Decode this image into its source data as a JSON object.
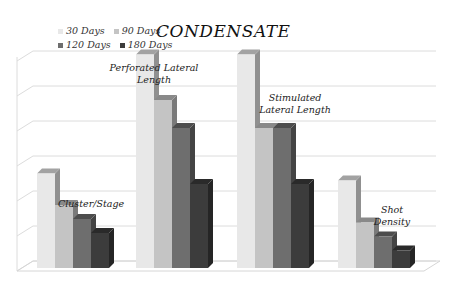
{
  "chart_data": {
    "type": "bar",
    "title": "CONDENSATE",
    "xlabel": "",
    "ylabel": "",
    "ylim": [
      0,
      6
    ],
    "grid": true,
    "legend_position": "top-left",
    "style": "3d-clustered-column",
    "categories": [
      "Cluster/Stage",
      "Perforated Lateral Length",
      "Stimulated Lateral Length",
      "Shot Density"
    ],
    "category_labels": [
      [
        "Cluster/Stage"
      ],
      [
        "Perforated Lateral",
        "Length"
      ],
      [
        "Stimulated",
        "Lateral Length"
      ],
      [
        "Shot Density"
      ]
    ],
    "series": [
      {
        "name": "30 Days",
        "values": [
          2.7,
          6.1,
          6.1,
          2.5
        ],
        "color": "#e8e8e8"
      },
      {
        "name": "90 Days",
        "values": [
          1.8,
          4.8,
          4.0,
          1.3
        ],
        "color": "#c4c4c4"
      },
      {
        "name": "120 Days",
        "values": [
          1.4,
          4.0,
          4.0,
          0.9
        ],
        "color": "#6e6e6e"
      },
      {
        "name": "180 Days",
        "values": [
          1.0,
          2.4,
          2.4,
          0.5
        ],
        "color": "#3c3c3c"
      }
    ]
  }
}
